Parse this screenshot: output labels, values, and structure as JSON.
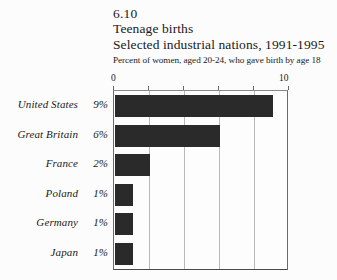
{
  "figure": {
    "number": "6.10",
    "title": "Teenage births",
    "subtitle": "Selected industrial nations, 1991-1995",
    "note": "Percent of women, aged 20-24, who gave birth by age 18"
  },
  "axis": {
    "min_label": "0",
    "max_label": "10"
  },
  "colors": {
    "bar": "#2a2a2a",
    "grid": "#b8b8b8",
    "frame": "#6b6b6b",
    "background": "#fcfcfc"
  },
  "rows": [
    {
      "name": "United States",
      "value_label": "9%"
    },
    {
      "name": "Great Britain",
      "value_label": "6%"
    },
    {
      "name": "France",
      "value_label": "2%"
    },
    {
      "name": "Poland",
      "value_label": "1%"
    },
    {
      "name": "Germany",
      "value_label": "1%"
    },
    {
      "name": "Japan",
      "value_label": "1%"
    }
  ],
  "chart_data": {
    "type": "bar",
    "orientation": "horizontal",
    "title": "Teenage births",
    "subtitle": "Selected industrial nations, 1991-1995",
    "note": "Percent of women, aged 20-24, who gave birth by age 18",
    "figure_number": "6.10",
    "categories": [
      "United States",
      "Great Britain",
      "France",
      "Poland",
      "Germany",
      "Japan"
    ],
    "values": [
      9,
      6,
      2,
      1,
      1,
      1
    ],
    "data_labels": [
      "9%",
      "6%",
      "2%",
      "1%",
      "1%",
      "1%"
    ],
    "xlabel": "",
    "ylabel": "",
    "xlim": [
      0,
      10
    ],
    "xticks": [
      0,
      2,
      4,
      6,
      8,
      10
    ],
    "xtick_labels": [
      "0",
      "",
      "",
      "",
      "",
      "10"
    ],
    "units": "percent",
    "grid": true,
    "grid_axis": "x",
    "legend": false
  }
}
